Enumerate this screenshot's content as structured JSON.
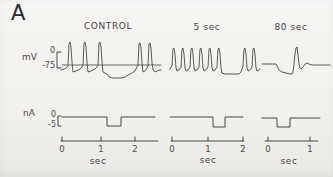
{
  "colors": {
    "paper": "#f2f1ee",
    "ink": "#474747"
  },
  "figure": {
    "panel_label": "A",
    "column_headers": [
      "CONTROL",
      "5 sec",
      "80 sec"
    ],
    "voltage_scale": {
      "unit": "mV",
      "top": "0",
      "bottom": "-75"
    },
    "current_scale": {
      "unit": "nA",
      "top": "0",
      "bottom": "-5"
    },
    "time_axes": [
      {
        "panel": "control",
        "ticks": [
          "0",
          "1",
          "2"
        ],
        "unit": "sec"
      },
      {
        "panel": "5sec",
        "ticks": [
          "0",
          "1",
          "2"
        ],
        "unit": "sec"
      },
      {
        "panel": "80sec",
        "ticks": [
          "0",
          "1"
        ],
        "unit": "sec"
      }
    ]
  },
  "traces": [
    {
      "name": "control-mv-zero-line",
      "d": "M62 65H161",
      "width": 0.8
    },
    {
      "name": "mv-scale-bracket",
      "d": "M61 52H57V68H61",
      "width": 1
    },
    {
      "name": "na-scale-bracket",
      "d": "M61 116H58V126H61",
      "width": 1
    },
    {
      "name": "control-time-axis",
      "d": "M61 141H158M62 141V137M101 141V137M135 141V137",
      "width": 1
    },
    {
      "name": "time-axis-5sec",
      "d": "M171 141H244M172 141V137M208 141V137M243 141V137",
      "width": 1
    },
    {
      "name": "time-axis-80sec",
      "d": "M265 141H318M268 141V137M310 141V137",
      "width": 1
    },
    {
      "name": "control-mv-trace",
      "width": 0.9,
      "points": [
        [
          61,
          70
        ],
        [
          64,
          69
        ],
        [
          66,
          68
        ],
        [
          68,
          66
        ],
        [
          69,
          44
        ],
        [
          70,
          42
        ],
        [
          71,
          47
        ],
        [
          72,
          62
        ],
        [
          73,
          72
        ],
        [
          76,
          71
        ],
        [
          80,
          69
        ],
        [
          82,
          67
        ],
        [
          83,
          65
        ],
        [
          84,
          43
        ],
        [
          85,
          42
        ],
        [
          86,
          47
        ],
        [
          87,
          62
        ],
        [
          88,
          72
        ],
        [
          91,
          71
        ],
        [
          95,
          69
        ],
        [
          97,
          67
        ],
        [
          98,
          65
        ],
        [
          99,
          43
        ],
        [
          100,
          42
        ],
        [
          101,
          47
        ],
        [
          102,
          62
        ],
        [
          103,
          72
        ],
        [
          105,
          73
        ],
        [
          107,
          74
        ],
        [
          109,
          77
        ],
        [
          113,
          78
        ],
        [
          118,
          78
        ],
        [
          122,
          78
        ],
        [
          125,
          77
        ],
        [
          128,
          75
        ],
        [
          132,
          73
        ],
        [
          135,
          71
        ],
        [
          137,
          67
        ],
        [
          138,
          65
        ],
        [
          139,
          44
        ],
        [
          140,
          43
        ],
        [
          141,
          48
        ],
        [
          142,
          63
        ],
        [
          143,
          72
        ],
        [
          145,
          71
        ],
        [
          147,
          68
        ],
        [
          148,
          66
        ],
        [
          149,
          44
        ],
        [
          150,
          43
        ],
        [
          151,
          48
        ],
        [
          152,
          63
        ],
        [
          153,
          70
        ],
        [
          155,
          72
        ],
        [
          157,
          71
        ],
        [
          159,
          70
        ],
        [
          161,
          70
        ]
      ]
    },
    {
      "name": "mv-trace-5sec",
      "width": 0.9,
      "points": [
        [
          170,
          69
        ],
        [
          171,
          67
        ],
        [
          172,
          66
        ],
        [
          173,
          49
        ],
        [
          174,
          48
        ],
        [
          175,
          54
        ],
        [
          176,
          68
        ],
        [
          177,
          71
        ],
        [
          179,
          70
        ],
        [
          181,
          67
        ],
        [
          182,
          49
        ],
        [
          183,
          48
        ],
        [
          184,
          54
        ],
        [
          185,
          68
        ],
        [
          186,
          71
        ],
        [
          188,
          70
        ],
        [
          190,
          67
        ],
        [
          191,
          49
        ],
        [
          192,
          48
        ],
        [
          193,
          54
        ],
        [
          194,
          68
        ],
        [
          195,
          71
        ],
        [
          197,
          70
        ],
        [
          199,
          67
        ],
        [
          200,
          49
        ],
        [
          201,
          48
        ],
        [
          202,
          54
        ],
        [
          203,
          68
        ],
        [
          204,
          71
        ],
        [
          206,
          70
        ],
        [
          208,
          67
        ],
        [
          209,
          49
        ],
        [
          210,
          48
        ],
        [
          211,
          54
        ],
        [
          212,
          68
        ],
        [
          213,
          71
        ],
        [
          215,
          70
        ],
        [
          217,
          67
        ],
        [
          218,
          49
        ],
        [
          219,
          48
        ],
        [
          220,
          54
        ],
        [
          221,
          68
        ],
        [
          222,
          73
        ],
        [
          225,
          74
        ],
        [
          230,
          74
        ],
        [
          235,
          74
        ],
        [
          239,
          74
        ],
        [
          241,
          72
        ],
        [
          242,
          69
        ],
        [
          243,
          66
        ],
        [
          244,
          49
        ],
        [
          245,
          48
        ],
        [
          246,
          54
        ],
        [
          247,
          68
        ],
        [
          248,
          71
        ],
        [
          250,
          70
        ],
        [
          252,
          67
        ],
        [
          253,
          49
        ],
        [
          254,
          48
        ],
        [
          255,
          54
        ],
        [
          256,
          68
        ],
        [
          257,
          71
        ],
        [
          259,
          70
        ],
        [
          260,
          69
        ]
      ]
    },
    {
      "name": "mv-trace-80sec",
      "width": 0.9,
      "points": [
        [
          262,
          64
        ],
        [
          268,
          64
        ],
        [
          274,
          64
        ],
        [
          276,
          64
        ],
        [
          277,
          66
        ],
        [
          279,
          70
        ],
        [
          282,
          72
        ],
        [
          286,
          73
        ],
        [
          290,
          74
        ],
        [
          292,
          74
        ],
        [
          293,
          72
        ],
        [
          294,
          64
        ],
        [
          295,
          54
        ],
        [
          296,
          48
        ],
        [
          297,
          47
        ],
        [
          298,
          55
        ],
        [
          299,
          64
        ],
        [
          300,
          68
        ],
        [
          301,
          69
        ],
        [
          303,
          67
        ],
        [
          305,
          64
        ],
        [
          307,
          63
        ],
        [
          309,
          64
        ],
        [
          312,
          65
        ],
        [
          318,
          65
        ],
        [
          324,
          65
        ],
        [
          330,
          65
        ]
      ]
    },
    {
      "name": "na-control-trace",
      "width": 1,
      "points": [
        [
          62,
          117
        ],
        [
          107,
          117
        ],
        [
          107,
          126
        ],
        [
          121,
          126
        ],
        [
          121,
          117
        ],
        [
          155,
          117
        ]
      ]
    },
    {
      "name": "na-trace-5sec",
      "width": 1,
      "points": [
        [
          170,
          117
        ],
        [
          213,
          117
        ],
        [
          213,
          127
        ],
        [
          225,
          127
        ],
        [
          225,
          117
        ],
        [
          243,
          117
        ]
      ]
    },
    {
      "name": "na-trace-80sec",
      "width": 1,
      "points": [
        [
          262,
          118
        ],
        [
          277,
          118
        ],
        [
          277,
          127
        ],
        [
          290,
          127
        ],
        [
          290,
          118
        ],
        [
          320,
          118
        ]
      ]
    }
  ]
}
